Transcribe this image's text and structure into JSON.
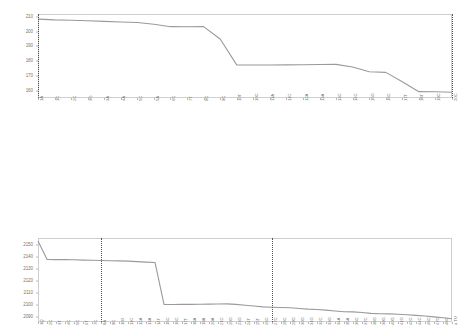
{
  "figure": {
    "background": "#ffffff",
    "line_color": "#9a9a9a",
    "frame_color": "#cfcfcf",
    "marker_line_color": "#555555"
  },
  "chart_data": [
    {
      "type": "line",
      "title": "",
      "xlabel": "",
      "ylabel": "",
      "grid": false,
      "legend": false,
      "ylim": [
        155,
        212
      ],
      "yticks": [
        160,
        170,
        180,
        190,
        200,
        210
      ],
      "ytick_labels": [
        "160",
        "170",
        "180",
        "190",
        "200",
        "210"
      ],
      "categories": [
        "1A",
        "1C",
        "2C",
        "3G",
        "3A",
        "4A",
        "5C",
        "5A",
        "6C",
        "7T",
        "8C",
        "9C",
        "10T",
        "10C",
        "11A",
        "11C",
        "12A",
        "13A",
        "13C",
        "14C",
        "15G",
        "16C",
        "17T",
        "18T",
        "19C",
        "20C"
      ],
      "x": [
        1,
        11,
        21,
        31,
        41,
        51,
        61,
        71,
        81,
        91,
        101,
        111,
        121,
        131,
        141,
        151,
        161,
        171,
        181,
        191,
        201,
        211,
        221,
        231,
        241,
        251
      ],
      "values": [
        208.5,
        208.0,
        207.8,
        207.4,
        207.0,
        206.6,
        206.2,
        205.0,
        203.4,
        203.3,
        203.4,
        195.0,
        177.5,
        177.4,
        177.4,
        177.5,
        177.6,
        177.7,
        177.8,
        176.0,
        172.8,
        172.4,
        166.0,
        159.3,
        159.2,
        158.9
      ],
      "vertical_markers": [
        1,
        251
      ],
      "vertical_marker_labels": [
        "1A",
        "20C"
      ]
    },
    {
      "type": "line",
      "title": "",
      "xlabel": "",
      "ylabel": "",
      "grid": false,
      "legend": false,
      "ylim": [
        2086,
        2156
      ],
      "yticks": [
        2090,
        2100,
        2110,
        2120,
        2130,
        2140,
        2150
      ],
      "ytick_labels": [
        "2090",
        "2100",
        "2110",
        "2120",
        "2130",
        "2140",
        "2150"
      ],
      "categories": [
        "1Q",
        "2C",
        "3T",
        "4C",
        "5C",
        "6T",
        "7C",
        "8A",
        "9C",
        "100",
        "11C",
        "12A",
        "13A",
        "14T",
        "15C",
        "16C",
        "17T",
        "18A",
        "19A",
        "20A",
        "21C",
        "20G",
        "23G",
        "24T",
        "25T",
        "26C",
        "27C",
        "28C",
        "29G",
        "30G",
        "31G",
        "32C",
        "33G",
        "34A",
        "35A",
        "36C",
        "37C",
        "38G",
        "39G",
        "40G",
        "41G",
        "42C",
        "44C",
        "46C",
        "47G",
        "48C",
        "a TU"
      ],
      "x": [
        1,
        2,
        3,
        4,
        5,
        6,
        7,
        8,
        9,
        10,
        11,
        12,
        13,
        14,
        15,
        16,
        17,
        18,
        19,
        20,
        21,
        22,
        23,
        24,
        25,
        26,
        27,
        28,
        29,
        30,
        31,
        32,
        33,
        34,
        35,
        36,
        37,
        38,
        39,
        40,
        41,
        42,
        43,
        44,
        45,
        46,
        47
      ],
      "values": [
        2153.5,
        2138.2,
        2138.0,
        2138.0,
        2137.9,
        2137.6,
        2137.4,
        2137.2,
        2137.0,
        2136.9,
        2136.7,
        2136.3,
        2135.9,
        2135.6,
        2100.6,
        2100.6,
        2100.7,
        2100.7,
        2100.8,
        2100.9,
        2101.0,
        2101.1,
        2100.7,
        2100.0,
        2099.3,
        2098.6,
        2098.3,
        2098.1,
        2097.9,
        2097.3,
        2096.7,
        2096.4,
        2095.9,
        2095.2,
        2094.6,
        2094.4,
        2093.9,
        2093.2,
        2092.9,
        2092.8,
        2092.5,
        2092.0,
        2091.5,
        2091.0,
        2090.3,
        2089.6,
        2088.7
      ],
      "vertical_markers": [
        8,
        27
      ],
      "vertical_marker_labels": [
        "8A",
        "27C"
      ]
    }
  ]
}
